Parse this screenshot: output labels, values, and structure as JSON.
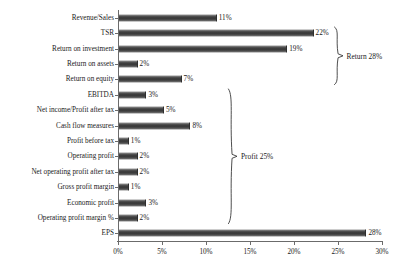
{
  "chart_data": {
    "type": "bar",
    "orientation": "horizontal",
    "title": "",
    "subtitle": "",
    "xlabel": "",
    "ylabel": "",
    "xlim": [
      0,
      30
    ],
    "grid": false,
    "legend": null,
    "bar_color": "#4a4a4a",
    "axis_color": "#6b6b6b",
    "xticks": [
      "0%",
      "5%",
      "10%",
      "15%",
      "20%",
      "25%",
      "30%"
    ],
    "xtick_values": [
      0,
      5,
      10,
      15,
      20,
      25,
      30
    ],
    "categories": [
      "Revenue/Sales",
      "TSR",
      "Return on investment",
      "Return on assets",
      "Return on equity",
      "EBITDA",
      "Net income/Profit after tax",
      "Cash flow measures",
      "Profit before tax",
      "Operating profit",
      "Net operating profit after tax",
      "Gross profit margin",
      "Economic profit",
      "Operating profit margin %",
      "EPS"
    ],
    "values": [
      11,
      22,
      19,
      2,
      7,
      3,
      5,
      8,
      1,
      2,
      2,
      1,
      3,
      2,
      28
    ],
    "value_labels": [
      "11%",
      "22%",
      "19%",
      "2%",
      "7%",
      "3%",
      "5%",
      "8%",
      "1%",
      "2%",
      "2%",
      "1%",
      "3%",
      "2%",
      "28%"
    ],
    "annotations": [
      {
        "label": "Return 28%",
        "spans_categories": [
          "TSR",
          "Return on investment",
          "Return on assets",
          "Return on equity"
        ],
        "span_start_index": 1,
        "span_end_index": 4
      },
      {
        "label": "Profit 25%",
        "spans_categories": [
          "EBITDA",
          "Net income/Profit after tax",
          "Cash flow measures",
          "Profit before tax",
          "Operating profit",
          "Net operating profit after tax",
          "Gross profit margin",
          "Economic profit",
          "Operating profit margin %"
        ],
        "span_start_index": 5,
        "span_end_index": 13
      }
    ]
  }
}
